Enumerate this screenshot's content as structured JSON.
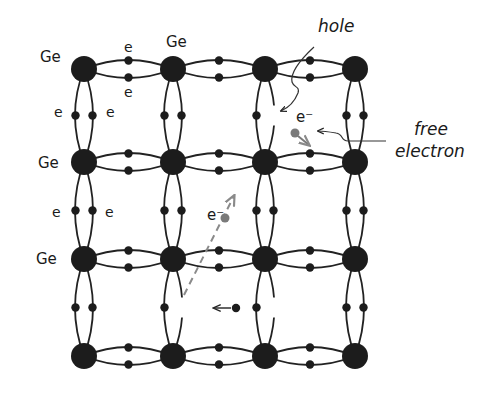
{
  "diagram": {
    "colors": {
      "atom": "#1c1c1c",
      "bond": "#222222",
      "free_electron": "#7a7a7a",
      "arrow_gray": "#8a8a8a",
      "background": "#ffffff"
    },
    "grid": {
      "columns_x": [
        84,
        173,
        265,
        355
      ],
      "rows_y": [
        69,
        162,
        259,
        356
      ],
      "atom_radius": 13
    },
    "labels": {
      "ge_top_left": "Ge",
      "ge_top_second": "Ge",
      "ge_row2": "Ge",
      "ge_row3": "Ge",
      "e_top_upper": "e",
      "e_top_lower": "e",
      "e_left_row1": "e",
      "e_right_row1": "e",
      "e_left_row2": "e",
      "e_right_row2": "e",
      "hole": "hole",
      "free_electron_line1": "free",
      "free_electron_line2": "electron",
      "e_minus_upper": "e⁻",
      "e_minus_middle": "e⁻"
    },
    "annotations": [
      {
        "id": "hole",
        "text": "hole",
        "points_to": "broken bond between column 3 rows 1-2"
      },
      {
        "id": "free-electron",
        "text": "free electron",
        "points_to": "electron near column 3 row 1-2 cell"
      },
      {
        "id": "electron-jump",
        "description": "dashed gray arrow showing electron moving from broken bond (col 2, rows 3-4) upward to e⁻"
      },
      {
        "id": "hole-motion",
        "description": "small arrow pointing left from electron in cell row 3-4"
      }
    ]
  }
}
